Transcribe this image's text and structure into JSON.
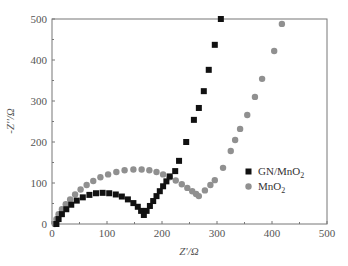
{
  "chart_data": {
    "type": "scatter",
    "title": "",
    "xlabel": "Z'/Ω",
    "ylabel": "-Z''/Ω",
    "xlim": [
      0,
      500
    ],
    "ylim": [
      0,
      500
    ],
    "xticks": [
      0,
      100,
      200,
      300,
      400,
      500
    ],
    "yticks": [
      0,
      100,
      200,
      300,
      400,
      500
    ],
    "grid": false,
    "legend_position": "inside-right",
    "series": [
      {
        "name": "GN/MnO₂",
        "marker": "square",
        "color": "#111111",
        "points": [
          [
            8,
            0
          ],
          [
            12,
            12
          ],
          [
            18,
            24
          ],
          [
            26,
            36
          ],
          [
            35,
            47
          ],
          [
            45,
            57
          ],
          [
            56,
            65
          ],
          [
            68,
            71
          ],
          [
            80,
            75
          ],
          [
            92,
            76
          ],
          [
            104,
            75
          ],
          [
            116,
            72
          ],
          [
            127,
            67
          ],
          [
            138,
            60
          ],
          [
            148,
            51
          ],
          [
            156,
            42
          ],
          [
            162,
            32
          ],
          [
            167,
            22
          ],
          [
            172,
            32
          ],
          [
            178,
            44
          ],
          [
            184,
            56
          ],
          [
            190,
            68
          ],
          [
            196,
            80
          ],
          [
            202,
            92
          ],
          [
            208,
            104
          ],
          [
            214,
            116
          ],
          [
            224,
            129
          ],
          [
            231,
            154
          ],
          [
            244,
            200
          ],
          [
            258,
            254
          ],
          [
            267,
            283
          ],
          [
            276,
            324
          ],
          [
            285,
            376
          ],
          [
            296,
            437
          ],
          [
            307,
            500
          ]
        ]
      },
      {
        "name": "MnO₂",
        "marker": "circle",
        "color": "#909090",
        "points": [
          [
            5,
            0
          ],
          [
            8,
            12
          ],
          [
            12,
            24
          ],
          [
            18,
            36
          ],
          [
            25,
            48
          ],
          [
            33,
            60
          ],
          [
            42,
            72
          ],
          [
            52,
            84
          ],
          [
            63,
            95
          ],
          [
            75,
            105
          ],
          [
            88,
            114
          ],
          [
            102,
            121
          ],
          [
            117,
            127
          ],
          [
            132,
            131
          ],
          [
            148,
            133
          ],
          [
            163,
            133
          ],
          [
            177,
            131
          ],
          [
            190,
            127
          ],
          [
            202,
            121
          ],
          [
            214,
            114
          ],
          [
            225,
            106
          ],
          [
            236,
            97
          ],
          [
            246,
            88
          ],
          [
            255,
            80
          ],
          [
            262,
            73
          ],
          [
            267,
            68
          ],
          [
            278,
            82
          ],
          [
            288,
            95
          ],
          [
            296,
            107
          ],
          [
            311,
            137
          ],
          [
            325,
            178
          ],
          [
            333,
            205
          ],
          [
            342,
            232
          ],
          [
            355,
            266
          ],
          [
            369,
            310
          ],
          [
            382,
            354
          ],
          [
            404,
            422
          ],
          [
            418,
            488
          ]
        ]
      }
    ]
  },
  "legend": {
    "items": [
      {
        "label": "GN/MnO",
        "sub": "2"
      },
      {
        "label": "MnO",
        "sub": "2"
      }
    ]
  },
  "axes": {
    "xlabel": "Z'/Ω",
    "ylabel": "-Z''/Ω"
  }
}
